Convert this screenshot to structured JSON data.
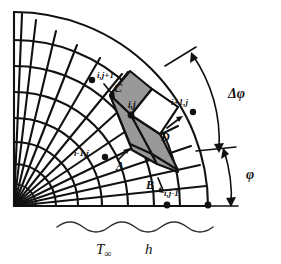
{
  "figure": {
    "colors": {
      "stroke": "#111111",
      "shaded_cell_fill": "#999999",
      "background": "#ffffff",
      "wavy_stroke": "#333333"
    },
    "nodes": [
      {
        "id": "node-center",
        "label": "i,j",
        "x": 131,
        "y": 115
      },
      {
        "id": "node-i-j-plus-1",
        "label": "i,j+1",
        "x": 96,
        "y": 75
      },
      {
        "id": "node-i-plus-1-j",
        "label": "i+1,j",
        "x": 171,
        "y": 118
      },
      {
        "id": "node-i-minus-1-j",
        "label": "i-1,j",
        "x": 96,
        "y": 156
      },
      {
        "id": "node-i-j-minus-1",
        "label": "i,j-1",
        "x": 165,
        "y": 196
      }
    ],
    "flux_labels": [
      {
        "id": "flux-a",
        "label": "A",
        "x": 119,
        "y": 166
      },
      {
        "id": "flux-b",
        "label": "B",
        "x": 150,
        "y": 184
      },
      {
        "id": "flux-c",
        "label": "C",
        "x": 117,
        "y": 88
      },
      {
        "id": "flux-d",
        "label": "D",
        "x": 160,
        "y": 137
      }
    ],
    "angle_labels": [
      {
        "id": "delta-phi",
        "label": "Δφ",
        "x": 234,
        "y": 93
      },
      {
        "id": "phi",
        "label": "φ",
        "x": 250,
        "y": 175
      }
    ],
    "ambient": {
      "temperature_symbol": "T",
      "temperature_subscript": "∞",
      "coefficient_symbol": "h",
      "temperature_x": 96,
      "coefficient_x": 145,
      "baseline_y": 252
    },
    "geometry": {
      "origin_x": 14,
      "origin_y": 206,
      "radii": [
        28,
        50,
        72,
        94,
        116,
        138,
        160,
        182
      ],
      "angle_start_deg": 0,
      "angle_end_deg": 90,
      "radial_count": 13
    }
  }
}
